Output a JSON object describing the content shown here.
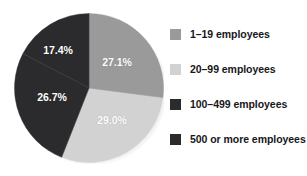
{
  "chart_data": {
    "type": "pie",
    "title": "",
    "subtitle": "",
    "xlabel": "",
    "ylabel": "",
    "legend_position": "right",
    "grid": false,
    "start_angle_deg": 0,
    "direction": "clockwise",
    "categories": [
      "1–19 employees",
      "20–99 employees",
      "100–499 employees",
      "500 or more employees"
    ],
    "values": [
      27.1,
      29.0,
      26.7,
      17.4
    ],
    "value_unit": "%",
    "slices": [
      {
        "label": "1–19 employees",
        "value": 27.1,
        "display": "27.1%",
        "color": "#9a9a9a",
        "label_color": "#ffffff",
        "label_x": 117,
        "label_y": 62
      },
      {
        "label": "20–99 employees",
        "value": 29.0,
        "display": "29.0%",
        "color": "#d2d2d2",
        "label_color": "#ffffff",
        "label_x": 112,
        "label_y": 120
      },
      {
        "label": "100–499 employees",
        "value": 26.7,
        "display": "26.7%",
        "color": "#2b2b2e",
        "label_color": "#ffffff",
        "label_x": 52,
        "label_y": 97
      },
      {
        "label": "500 or more employees",
        "value": 17.4,
        "display": "17.4%",
        "color": "#2b2b2e",
        "label_color": "#ffffff",
        "label_x": 58,
        "label_y": 50
      }
    ]
  },
  "legend": {
    "items": [
      {
        "label": "1–19 employees",
        "color": "#9a9a9a",
        "top": 5
      },
      {
        "label": "20–99 employees",
        "color": "#d2d2d2",
        "top": 40
      },
      {
        "label": "100–499 employees",
        "color": "#2b2b2e",
        "top": 75
      },
      {
        "label": "500 or more employees",
        "color": "#2b2b2e",
        "top": 110
      }
    ]
  },
  "colors": {
    "background": "#ffffff",
    "text": "#17171a",
    "slice_light": "#d2d2d2",
    "slice_medium": "#9a9a9a",
    "slice_dark": "#2b2b2e",
    "label_text": "#ffffff"
  }
}
